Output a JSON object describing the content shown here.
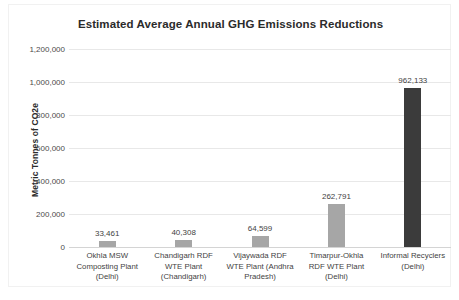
{
  "chart_data": {
    "type": "bar",
    "title": "Estimated Average Annual GHG Emissions Reductions",
    "xlabel": "",
    "ylabel": "Metric Tonnes of CO2e",
    "ylim": [
      0,
      1200000
    ],
    "ytick_labels": [
      "1,200,000",
      "1,000,000",
      "800,000",
      "600,000",
      "400,000",
      "200,000",
      "0"
    ],
    "ytick_values": [
      1200000,
      1000000,
      800000,
      600000,
      400000,
      200000,
      0
    ],
    "grid": true,
    "legend": "none",
    "categories": [
      "Okhla MSW Composting Plant (Delhi)",
      "Chandigarh RDF WTE Plant (Chandigarh)",
      "Vijaywada RDF WTE Plant (Andhra Pradesh)",
      "Timarpur-Okhla RDF WTE Plant (Delhi)",
      "Informal Recyclers (Delhi)"
    ],
    "category_lines": [
      [
        "Okhla MSW",
        "Composting Plant",
        "(Delhi)"
      ],
      [
        "Chandigarh RDF",
        "WTE Plant",
        "(Chandigarh)"
      ],
      [
        "Vijaywada RDF",
        "WTE Plant (Andhra",
        "Pradesh)"
      ],
      [
        "Timarpur-Okhla",
        "RDF WTE Plant",
        "(Delhi)"
      ],
      [
        "Informal Recyclers",
        "(Delhi)"
      ]
    ],
    "values": [
      33461,
      40308,
      64599,
      262791,
      962133
    ],
    "value_labels": [
      "33,461",
      "40,308",
      "64,599",
      "262,791",
      "962,133"
    ],
    "bar_colors": [
      "#a6a6a6",
      "#a6a6a6",
      "#a6a6a6",
      "#a6a6a6",
      "#3b3b3b"
    ]
  }
}
